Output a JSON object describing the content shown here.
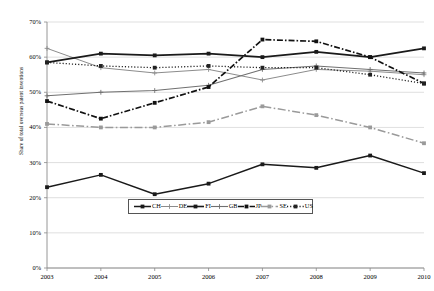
{
  "chart_data": {
    "type": "line",
    "title": "",
    "xlabel": "",
    "ylabel": "Share of total overseas patent inventions",
    "x": [
      2003,
      2004,
      2005,
      2006,
      2007,
      2008,
      2009,
      2010
    ],
    "xtick_labels": [
      "2003",
      "2004",
      "2005",
      "2006",
      "2007",
      "2008",
      "2009",
      "2010"
    ],
    "ytick_labels": [
      "0%",
      "10%",
      "20%",
      "30%",
      "40%",
      "50%",
      "60%",
      "70%"
    ],
    "ytick_values": [
      0,
      10,
      20,
      30,
      40,
      50,
      60,
      70
    ],
    "ylim": [
      0,
      70
    ],
    "xlim": [
      2003,
      2010
    ],
    "grid": true,
    "legend_position": "inside-bottom-center",
    "series": [
      {
        "name": "CH",
        "style": "solid",
        "marker": "square",
        "color": "#1a1a1a",
        "width": 1.5,
        "values": [
          23.0,
          26.5,
          21.0,
          24.0,
          29.5,
          28.5,
          32.0,
          27.0
        ]
      },
      {
        "name": "DE",
        "style": "solid",
        "marker": "plus",
        "color": "#8c8c8c",
        "width": 1.0,
        "values": [
          62.5,
          57.0,
          55.5,
          56.5,
          53.5,
          56.5,
          56.0,
          55.0
        ]
      },
      {
        "name": "FI",
        "style": "solid",
        "marker": "square",
        "color": "#1a1a1a",
        "width": 1.6,
        "values": [
          58.5,
          61.0,
          60.5,
          61.0,
          60.0,
          61.5,
          60.0,
          62.5
        ]
      },
      {
        "name": "GB",
        "style": "solid",
        "marker": "plus",
        "color": "#707070",
        "width": 1.1,
        "values": [
          49.0,
          50.0,
          50.5,
          52.0,
          56.5,
          57.5,
          56.5,
          55.5
        ]
      },
      {
        "name": "JP",
        "style": "dashdot",
        "marker": "square",
        "color": "#111111",
        "width": 1.7,
        "values": [
          47.5,
          42.5,
          47.0,
          51.5,
          65.0,
          64.5,
          60.0,
          52.5
        ]
      },
      {
        "name": "SE",
        "style": "longdashdot",
        "marker": "square",
        "color": "#9a9a9a",
        "width": 1.5,
        "values": [
          41.0,
          40.0,
          40.0,
          41.5,
          46.0,
          43.5,
          40.0,
          35.5
        ]
      },
      {
        "name": "US",
        "style": "dotted",
        "marker": "square",
        "color": "#222222",
        "width": 1.3,
        "values": [
          58.5,
          57.5,
          57.0,
          57.5,
          57.0,
          57.0,
          55.0,
          52.5
        ]
      }
    ]
  },
  "legend": {
    "items": [
      {
        "label": "CH"
      },
      {
        "label": "DE"
      },
      {
        "label": "FI"
      },
      {
        "label": "GB"
      },
      {
        "label": "JP"
      },
      {
        "label": "SE"
      },
      {
        "label": "US"
      }
    ]
  }
}
